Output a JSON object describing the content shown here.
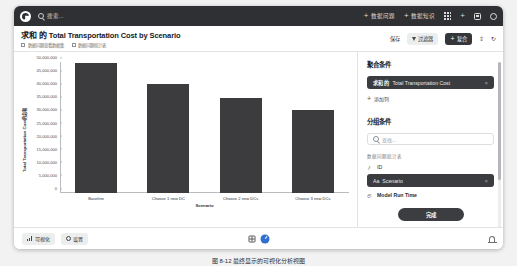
{
  "topbar": {
    "logo": "app-logo",
    "search_placeholder": "搜索...",
    "actions": [
      {
        "label": "数据问题",
        "icon": "plus-icon"
      },
      {
        "label": "数据知识",
        "icon": "plus-icon"
      }
    ],
    "icons": [
      "apps-grid-icon",
      "plus-icon",
      "new-window-icon",
      "settings-gear-icon"
    ]
  },
  "titlebar": {
    "title_prefix": "求和 的",
    "title_main": "Total Transportation Cost by Scenario",
    "meta": [
      "数据问题查看数据集",
      "数据问题统计表"
    ],
    "save_label": "保存",
    "filter_label": "过滤器",
    "compound_label": "复合",
    "compound_plus": "+",
    "share_icon": "share-icon",
    "refresh_icon": "refresh-icon"
  },
  "panel": {
    "agg_heading": "聚合条件",
    "agg_chip": {
      "prefix": "求和 的",
      "name": "Total Transportation Cost",
      "remove": "×"
    },
    "add_column": "添加列",
    "group_heading": "分组条件",
    "search_placeholder": "查找...",
    "group_source": "数据问题统计表",
    "fields": [
      {
        "icon": "key-icon",
        "label": "ID",
        "selected": false
      },
      {
        "icon": "Aa",
        "label": "Scenario",
        "selected": true,
        "remove": "×"
      },
      {
        "icon": "clock-icon",
        "label": "Model Run Time",
        "selected": false
      }
    ],
    "done_label": "完成"
  },
  "footer": {
    "visualization_label": "可视化",
    "settings_label": "设置",
    "table_icon": "table-view-icon",
    "chart_icon": "chart-view-icon",
    "bell_icon": "notification-icon"
  },
  "caption": "图 8-12 最终显示的可视化分析视图",
  "colors": {
    "bar": "#3c3c3f",
    "topbar": "#2f3033",
    "accent": "#2f6fd0",
    "dark_button": "#34363a"
  },
  "chart_data": {
    "type": "bar",
    "title": "Total Transportation Cost by Scenario",
    "xlabel": "Scenario",
    "ylabel": "Total Transportation Cost的总和",
    "categories": [
      "Baseline",
      "Choose 1 new DC",
      "Choose 2 new DCs",
      "Choose 3 new DCs"
    ],
    "values": [
      49700000,
      41700000,
      36400000,
      31500000
    ],
    "ylim": [
      0,
      50000000
    ],
    "yticks": [
      0,
      5000000,
      10000000,
      15000000,
      20000000,
      25000000,
      30000000,
      35000000,
      40000000,
      45000000,
      50000000
    ],
    "ytick_labels": [
      "0",
      "5,000,000",
      "10,000,000",
      "15,000,000",
      "20,000,000",
      "25,000,000",
      "30,000,000",
      "35,000,000",
      "40,000,000",
      "45,000,000",
      "50,000,000"
    ],
    "grid": false,
    "legend": false
  }
}
